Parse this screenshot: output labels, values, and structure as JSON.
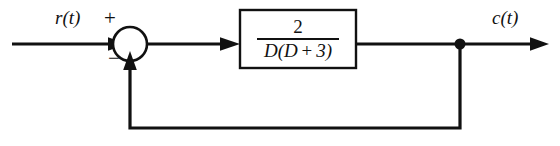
{
  "diagram": {
    "type": "control-system-block-diagram",
    "stroke_color": "#111111",
    "background_color": "#ffffff",
    "width": 560,
    "height": 146,
    "input": {
      "label": "r(t)",
      "name": "reference-input",
      "line": {
        "x1": 12,
        "y1": 44,
        "x2": 130,
        "y2": 44
      },
      "label_pos": {
        "x": 55,
        "y": 8
      }
    },
    "summing_junction": {
      "name": "summing-junction",
      "shape": "circle",
      "center": {
        "x": 130,
        "y": 44
      },
      "radius": 17,
      "fill": "#ffffff",
      "positive_sign": "+",
      "negative_sign": "−",
      "positive_sign_pos": {
        "x": 104,
        "y": 8
      },
      "negative_sign_pos": {
        "x": 108,
        "y": 48
      }
    },
    "forward_link": {
      "name": "error-signal-line",
      "line": {
        "x1": 147,
        "y1": 44,
        "x2": 240,
        "y2": 44
      }
    },
    "block": {
      "name": "transfer-function-block",
      "x": 240,
      "y": 10,
      "width": 116,
      "height": 58,
      "fill": "#ffffff",
      "transfer_function": {
        "numerator": "2",
        "denominator": "D(D + 3)",
        "denominator_parts": {
          "d1": "D(D",
          "operator": "+",
          "d2": "3)"
        },
        "full": "2 / (D(D + 3))"
      }
    },
    "output": {
      "label": "c(t)",
      "name": "controlled-output",
      "line": {
        "x1": 356,
        "y1": 44,
        "x2": 548,
        "y2": 44
      },
      "label_pos": {
        "x": 492,
        "y": 8
      }
    },
    "takeoff_node": {
      "name": "feedback-takeoff-node",
      "center": {
        "x": 460,
        "y": 44
      },
      "radius": 5.5,
      "fill": "#111111"
    },
    "feedback_path": {
      "name": "unity-feedback-path",
      "gain": "1",
      "has_block": false,
      "points": [
        {
          "x": 460,
          "y": 44
        },
        {
          "x": 460,
          "y": 128
        },
        {
          "x": 130,
          "y": 128
        },
        {
          "x": 130,
          "y": 61
        }
      ]
    }
  }
}
